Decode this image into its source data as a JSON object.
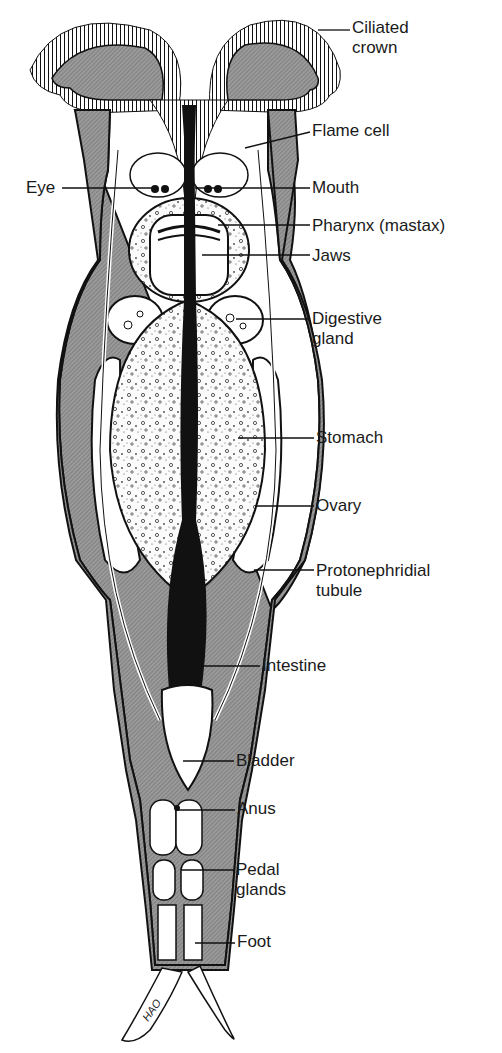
{
  "diagram": {
    "signature": "HAO",
    "labels": [
      {
        "id": "ciliated-crown",
        "text": "Ciliated",
        "text2": "crown",
        "x": 352,
        "y": 47,
        "tip": [
          318,
          30
        ]
      },
      {
        "id": "flame-cell",
        "text": "Flame cell",
        "x": 312,
        "y": 123,
        "tip": [
          245,
          148
        ]
      },
      {
        "id": "eye",
        "text": "Eye",
        "x": 26,
        "y": 179,
        "tip": [
          154,
          188
        ]
      },
      {
        "id": "mouth",
        "text": "Mouth",
        "x": 312,
        "y": 179,
        "tip": [
          195,
          188
        ]
      },
      {
        "id": "pharynx",
        "text": "Pharynx (mastax)",
        "x": 312,
        "y": 217,
        "tip": [
          218,
          225
        ]
      },
      {
        "id": "jaws",
        "text": "Jaws",
        "x": 312,
        "y": 247,
        "tip": [
          202,
          255
        ]
      },
      {
        "id": "digestive-gland",
        "text": "Digestive",
        "text2": "gland",
        "x": 312,
        "y": 310,
        "tip": [
          236,
          319
        ]
      },
      {
        "id": "stomach",
        "text": "Stomach",
        "x": 316,
        "y": 429,
        "tip": [
          238,
          438
        ]
      },
      {
        "id": "ovary",
        "text": "Ovary",
        "x": 316,
        "y": 498,
        "tip": [
          255,
          506
        ]
      },
      {
        "id": "protonephridial-tubule",
        "text": "Protonephridial",
        "text2": "tubule",
        "x": 316,
        "y": 562,
        "tip": [
          254,
          570
        ]
      },
      {
        "id": "intestine",
        "text": "Intestine",
        "x": 262,
        "y": 657,
        "tip": [
          180,
          666
        ]
      },
      {
        "id": "bladder",
        "text": "Bladder",
        "x": 236,
        "y": 752,
        "tip": [
          183,
          761
        ]
      },
      {
        "id": "anus",
        "text": "Anus",
        "x": 237,
        "y": 800,
        "tip": [
          176,
          810
        ]
      },
      {
        "id": "pedal-glands",
        "text": "Pedal",
        "text2": "glands",
        "x": 236,
        "y": 862,
        "tip": [
          181,
          870
        ]
      },
      {
        "id": "foot",
        "text": "Foot",
        "x": 237,
        "y": 933,
        "tip": [
          195,
          943
        ]
      }
    ]
  }
}
